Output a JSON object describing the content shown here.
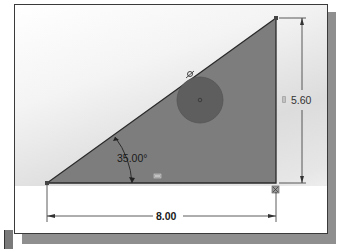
{
  "sketch": {
    "dimensions": {
      "angle": "35.00°",
      "height": "5.60",
      "width": "8.00"
    },
    "colors": {
      "triangle_fill": "#7d7d7d",
      "circle_fill": "#5e5e5e",
      "line": "#2a2a2a",
      "dimension_line": "#333333",
      "background_gradient_mid": "#dcdcdc"
    },
    "shapes": {
      "triangle": "right-triangle",
      "circle": "tangent-circle"
    },
    "relation_icons": [
      "tangent-icon",
      "horizontal-icon",
      "vertical-icon",
      "perpendicular-icon"
    ]
  }
}
